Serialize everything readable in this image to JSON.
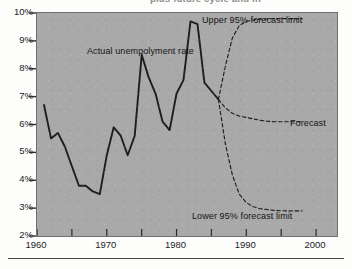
{
  "page": {
    "heading_fragment": "plus future cycle and in",
    "background_color": "#fdfdfc",
    "rule_color": "#4a4a4a"
  },
  "figure": {
    "plot_background_color": "#a9a9a9",
    "plot_border_color": "#6f6f6f",
    "line_color": "#1e1e1e",
    "annotations": {
      "actual": "Actual unempolyment rate",
      "upper": "Upper 95% forecast limit",
      "lower": "Lower 95% forecast limit",
      "forecast": "Forecast"
    }
  },
  "chart_data": {
    "type": "line",
    "title": "",
    "subtitle": "",
    "xlabel": "",
    "ylabel": "",
    "xlim": [
      1960,
      2003
    ],
    "ylim": [
      2,
      10
    ],
    "grid": false,
    "legend_position": "inline-annotations",
    "x_tick_labels": [
      "1960",
      "1970",
      "1980",
      "1990",
      "2000"
    ],
    "x_tick_values": [
      1960,
      1970,
      1980,
      1990,
      2000
    ],
    "x_minor_tick_values": [
      1965,
      1975,
      1985,
      1995
    ],
    "y_tick_labels": [
      "2%",
      "3%",
      "4%",
      "5%",
      "6%",
      "7%",
      "8%",
      "9%",
      "10%"
    ],
    "y_tick_values": [
      2,
      3,
      4,
      5,
      6,
      7,
      8,
      9,
      10
    ],
    "series": [
      {
        "name": "Actual unempolyment rate",
        "style": "solid",
        "x": [
          1961,
          1962,
          1963,
          1964,
          1965,
          1966,
          1967,
          1968,
          1969,
          1970,
          1971,
          1972,
          1973,
          1974,
          1975,
          1976,
          1977,
          1978,
          1979,
          1980,
          1981,
          1982,
          1983,
          1984,
          1985,
          1986
        ],
        "values": [
          6.7,
          5.5,
          5.7,
          5.2,
          4.5,
          3.8,
          3.8,
          3.6,
          3.5,
          4.9,
          5.9,
          5.6,
          4.9,
          5.6,
          8.5,
          7.7,
          7.1,
          6.1,
          5.8,
          7.1,
          7.6,
          9.7,
          9.6,
          7.5,
          7.2,
          6.9
        ]
      },
      {
        "name": "Forecast",
        "style": "dashed",
        "x": [
          1986,
          1987,
          1988,
          1989,
          1990,
          1991,
          1992,
          1993,
          1994,
          1996,
          1998
        ],
        "values": [
          6.9,
          6.6,
          6.4,
          6.3,
          6.25,
          6.2,
          6.15,
          6.12,
          6.1,
          6.1,
          6.1
        ]
      },
      {
        "name": "Upper 95% forecast limit",
        "style": "dashed",
        "x": [
          1986,
          1987,
          1988,
          1989,
          1990,
          1991,
          1992,
          1994,
          1996,
          1998
        ],
        "values": [
          6.9,
          8.1,
          9.1,
          9.55,
          9.7,
          9.75,
          9.78,
          9.8,
          9.8,
          9.8
        ]
      },
      {
        "name": "Lower 95% forecast limit",
        "style": "dashed",
        "x": [
          1986,
          1987,
          1988,
          1989,
          1990,
          1991,
          1992,
          1994,
          1996,
          1998
        ],
        "values": [
          6.9,
          5.3,
          4.2,
          3.5,
          3.2,
          3.05,
          2.98,
          2.92,
          2.9,
          2.9
        ]
      }
    ]
  }
}
